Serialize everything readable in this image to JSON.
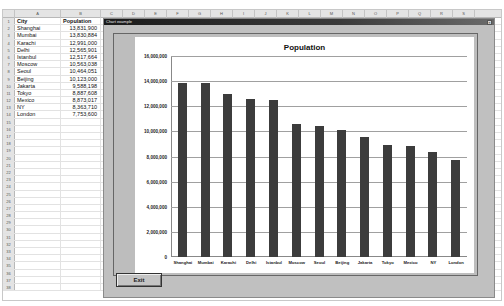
{
  "spreadsheet": {
    "column_headers": [
      "A",
      "B",
      "C",
      "D",
      "E",
      "F",
      "G",
      "H",
      "I",
      "J",
      "K",
      "L",
      "M",
      "N",
      "O",
      "P",
      "Q",
      "R",
      "S"
    ],
    "header_row": {
      "city": "City",
      "population": "Population"
    },
    "rows": [
      {
        "num": "1",
        "city": "City",
        "population": "Population"
      },
      {
        "num": "2",
        "city": "Shanghai",
        "population": "13,831,900"
      },
      {
        "num": "3",
        "city": "Mumbai",
        "population": "13,830,884"
      },
      {
        "num": "4",
        "city": "Karachi",
        "population": "12,991,000"
      },
      {
        "num": "5",
        "city": "Delhi",
        "population": "12,565,901"
      },
      {
        "num": "6",
        "city": "Istanbul",
        "population": "12,517,664"
      },
      {
        "num": "7",
        "city": "Moscow",
        "population": "10,563,038"
      },
      {
        "num": "8",
        "city": "Seoul",
        "population": "10,464,051"
      },
      {
        "num": "9",
        "city": "Beijing",
        "population": "10,123,000"
      },
      {
        "num": "10",
        "city": "Jakarta",
        "population": "9,588,198"
      },
      {
        "num": "11",
        "city": "Tokyo",
        "population": "8,887,608"
      },
      {
        "num": "12",
        "city": "Mexico",
        "population": "8,873,017"
      },
      {
        "num": "13",
        "city": "NY",
        "population": "8,363,710"
      },
      {
        "num": "14",
        "city": "London",
        "population": "7,753,600"
      }
    ],
    "empty_row_numbers": [
      "15",
      "16",
      "17",
      "18",
      "19",
      "20",
      "21",
      "22",
      "23",
      "24",
      "25",
      "26",
      "27",
      "28",
      "29",
      "30",
      "31",
      "32",
      "33",
      "34",
      "35",
      "36",
      "37",
      "38"
    ]
  },
  "dialog": {
    "title": "Chart example",
    "close_label": "×",
    "exit_label": "Exit"
  },
  "chart_data": {
    "type": "bar",
    "title": "Population",
    "xlabel": "",
    "ylabel": "",
    "ylim": [
      0,
      16000000
    ],
    "grid": true,
    "legend": "none",
    "yticks": [
      "16,000,000",
      "14,000,000",
      "12,000,000",
      "10,000,000",
      "8,000,000",
      "6,000,000",
      "4,000,000",
      "2,000,000",
      "0"
    ],
    "categories": [
      "Shanghai",
      "Mumbai",
      "Karachi",
      "Delhi",
      "Istanbul",
      "Moscow",
      "Seoul",
      "Beijing",
      "Jakarta",
      "Tokyo",
      "Mexico",
      "NY",
      "London"
    ],
    "values": [
      13831900,
      13830884,
      12991000,
      12565901,
      12517664,
      10563038,
      10464051,
      10123000,
      9588198,
      8887608,
      8873017,
      8363710,
      7753600
    ],
    "bar_color": "#3c3c3c"
  }
}
